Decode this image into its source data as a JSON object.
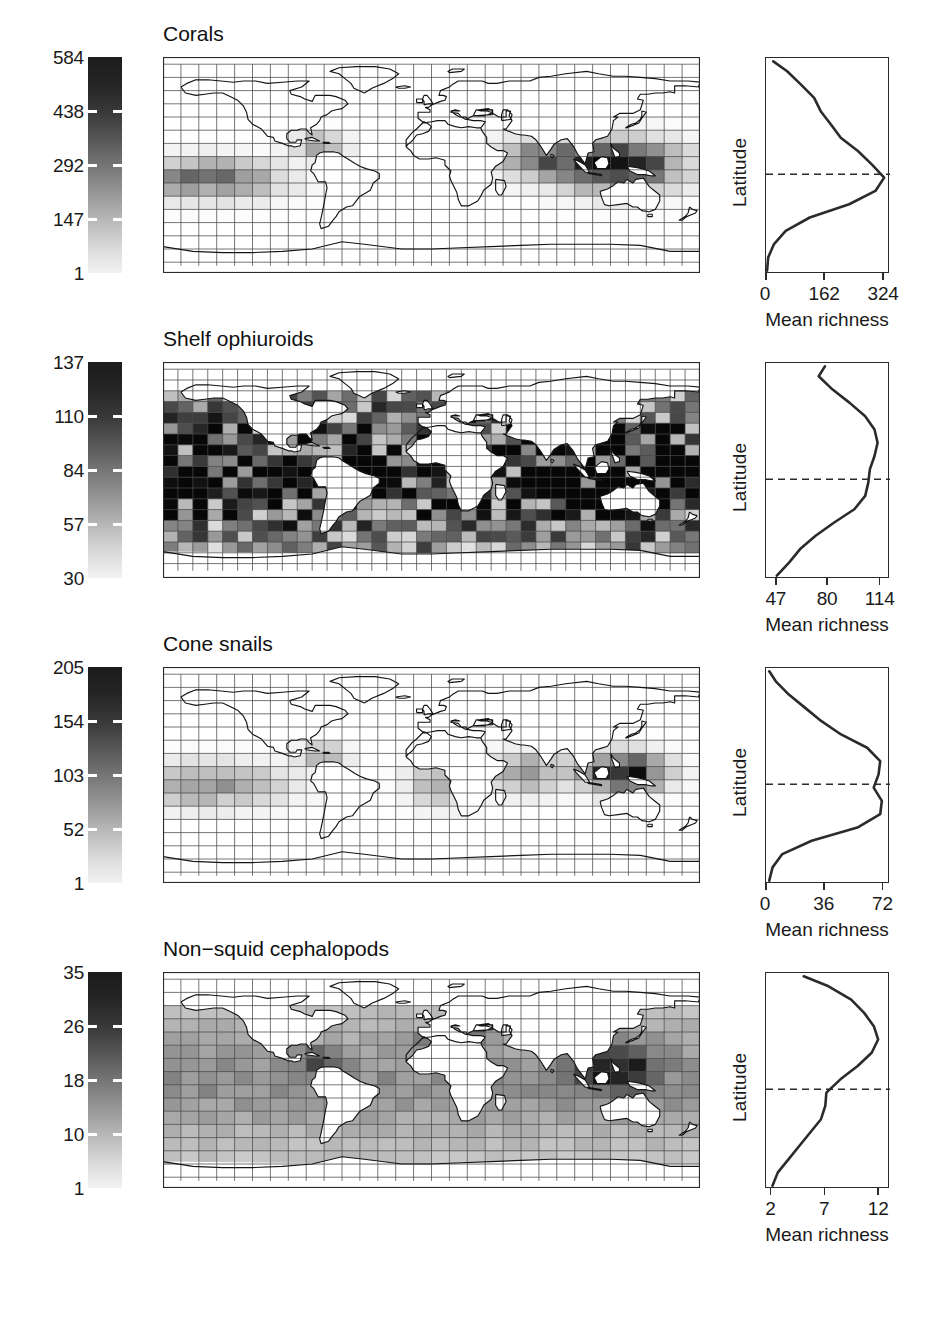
{
  "figure": {
    "type": "multi-panel-map-figure",
    "width": 938,
    "height": 1329,
    "background": "#ffffff"
  },
  "panels": [
    {
      "id": "corals",
      "title": "Corals",
      "colorbar": {
        "name": "species-richness-colorbar",
        "labels": [
          "584",
          "438",
          "292",
          "147",
          "1"
        ],
        "min": 1,
        "max": 584,
        "ramp": "grayscale-dark-to-light"
      },
      "map": {
        "name": "world-richness-map-corals",
        "projection": "cylindrical-equidistant",
        "grid": "5-degree-cells"
      },
      "plot": {
        "ylabel": "Latitude",
        "xlabel": "Mean richness",
        "xticks": [
          "0",
          "162",
          "324"
        ]
      },
      "chart_data": {
        "type": "line",
        "title": "Corals",
        "xlabel": "Mean richness",
        "ylabel": "Latitude",
        "xlim": [
          0,
          340
        ],
        "ylim": [
          -60,
          70
        ],
        "xticks": [
          0,
          162,
          324
        ],
        "grid": false,
        "equator_line": 0,
        "x": [
          -58,
          -50,
          -42,
          -34,
          -26,
          -18,
          -10,
          -2,
          6,
          14,
          22,
          30,
          38,
          46,
          54,
          62,
          68
        ],
        "values": [
          3,
          6,
          22,
          54,
          120,
          228,
          300,
          324,
          290,
          252,
          205,
          178,
          150,
          132,
          96,
          58,
          20
        ]
      }
    },
    {
      "id": "shelf-ophiuroids",
      "title": "Shelf ophiuroids",
      "colorbar": {
        "name": "species-richness-colorbar",
        "labels": [
          "137",
          "110",
          "84",
          "57",
          "30"
        ],
        "min": 30,
        "max": 137,
        "ramp": "grayscale-dark-to-light"
      },
      "map": {
        "name": "world-richness-map-shelf-ophiuroids",
        "projection": "cylindrical-equidistant",
        "grid": "5-degree-cells"
      },
      "plot": {
        "ylabel": "Latitude",
        "xlabel": "Mean richness",
        "xticks": [
          "47",
          "80",
          "114"
        ]
      },
      "chart_data": {
        "type": "line",
        "title": "Shelf ophiuroids",
        "xlabel": "Mean richness",
        "ylabel": "Latitude",
        "xlim": [
          40,
          120
        ],
        "ylim": [
          -60,
          70
        ],
        "xticks": [
          47,
          80,
          114
        ],
        "grid": false,
        "equator_line": 0,
        "x": [
          -58,
          -50,
          -42,
          -34,
          -26,
          -18,
          -10,
          -2,
          6,
          14,
          22,
          30,
          38,
          46,
          54,
          62,
          68
        ],
        "values": [
          47,
          55,
          62,
          72,
          84,
          97,
          104,
          106,
          107,
          110,
          112,
          110,
          104,
          94,
          83,
          74,
          78
        ]
      }
    },
    {
      "id": "cone-snails",
      "title": "Cone snails",
      "colorbar": {
        "name": "species-richness-colorbar",
        "labels": [
          "205",
          "154",
          "103",
          "52",
          "1"
        ],
        "min": 1,
        "max": 205,
        "ramp": "grayscale-dark-to-light"
      },
      "map": {
        "name": "world-richness-map-cone-snails",
        "projection": "cylindrical-equidistant",
        "grid": "5-degree-cells"
      },
      "plot": {
        "ylabel": "Latitude",
        "xlabel": "Mean richness",
        "xticks": [
          "0",
          "36",
          "72"
        ]
      },
      "chart_data": {
        "type": "line",
        "title": "Cone snails",
        "xlabel": "Mean richness",
        "ylabel": "Latitude",
        "xlim": [
          0,
          76
        ],
        "ylim": [
          -60,
          70
        ],
        "xticks": [
          0,
          36,
          72
        ],
        "grid": false,
        "equator_line": 0,
        "x": [
          -58,
          -50,
          -42,
          -34,
          -26,
          -18,
          -10,
          -2,
          6,
          14,
          22,
          30,
          38,
          46,
          54,
          62,
          68
        ],
        "values": [
          2,
          4,
          10,
          28,
          56,
          70,
          71,
          66,
          69,
          70,
          62,
          46,
          34,
          24,
          14,
          6,
          2
        ]
      }
    },
    {
      "id": "non-squid-cephalopods",
      "title": "Non−squid cephalopods",
      "colorbar": {
        "name": "species-richness-colorbar",
        "labels": [
          "35",
          "26",
          "18",
          "10",
          "1"
        ],
        "min": 1,
        "max": 35,
        "ramp": "grayscale-dark-to-light"
      },
      "map": {
        "name": "world-richness-map-non-squid-cephalopods",
        "projection": "cylindrical-equidistant",
        "grid": "5-degree-cells"
      },
      "plot": {
        "ylabel": "Latitude",
        "xlabel": "Mean richness",
        "xticks": [
          "2",
          "7",
          "12"
        ]
      },
      "chart_data": {
        "type": "line",
        "title": "Non−squid cephalopods",
        "xlabel": "Mean richness",
        "ylabel": "Latitude",
        "xlim": [
          1.5,
          13
        ],
        "ylim": [
          -60,
          70
        ],
        "xticks": [
          2,
          7,
          12
        ],
        "grid": false,
        "equator_line": 0,
        "x": [
          -58,
          -50,
          -42,
          -34,
          -26,
          -18,
          -10,
          -2,
          6,
          14,
          22,
          30,
          38,
          46,
          54,
          62,
          68
        ],
        "values": [
          2.1,
          2.6,
          3.6,
          4.6,
          5.6,
          6.6,
          7.0,
          7.1,
          8.4,
          10.0,
          11.3,
          11.9,
          11.5,
          10.6,
          9.4,
          7.3,
          5.0
        ]
      }
    }
  ]
}
